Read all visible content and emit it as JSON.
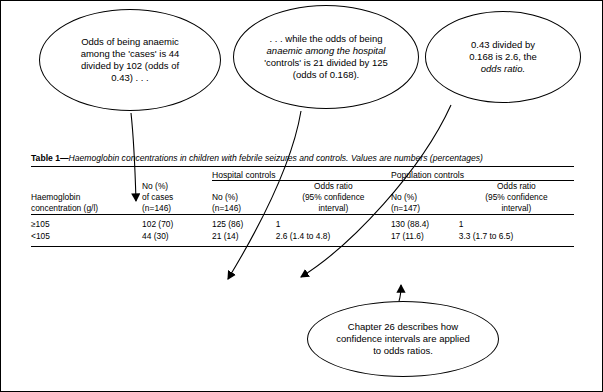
{
  "callouts": {
    "cases": {
      "line1": "Odds of being anaemic",
      "line2": "among the 'cases' is 44",
      "line3": "divided by 102 (odds of",
      "line4": "0.43) . . ."
    },
    "hospital": {
      "line1": ". . . while the odds of being",
      "line2": "anaemic among the hospital",
      "line3": "'controls' is 21 divided by 125",
      "line4": "(odds of 0.168)."
    },
    "ratio": {
      "line1": "0.43 divided by",
      "line2": "0.168 is 2.6, the",
      "line3": "odds ratio."
    },
    "chapter": {
      "line1": "Chapter 26 describes how",
      "line2": "confidence intervals are applied",
      "line3": "to odds ratios."
    }
  },
  "table": {
    "caption_label": "Table 1",
    "caption_dash": "—",
    "caption_text": "Haemoglobin concentrations in children with febrile seizures and controls. Values are numbers (percentages)",
    "group_headers": {
      "hospital": "Hospital controls",
      "population": "Population controls"
    },
    "column_headers": {
      "haemoglobin": [
        "Haemoglobin",
        "concentration (g/l)"
      ],
      "cases": [
        "No (%)",
        "of cases",
        "(n=146)"
      ],
      "hospital_no": [
        "No (%)",
        "(n=146)"
      ],
      "hospital_or": [
        "Odds ratio",
        "(95% confidence",
        "interval)"
      ],
      "population_no": [
        "No (%)",
        "(n=147)"
      ],
      "population_or": [
        "Odds ratio",
        "(95% confidence",
        "interval)"
      ]
    },
    "rows": [
      {
        "label": "≥105",
        "cases": "102 (70)",
        "hospital_no": "125 (86)",
        "hospital_or": "1",
        "population_no": "130 (88.4)",
        "population_or": "1"
      },
      {
        "label": "<105",
        "cases": "44 (30)",
        "hospital_no": "21 (14)",
        "hospital_or": "2.6 (1.4 to 4.8)",
        "population_no": "17 (11.6)",
        "population_or": "3.3 (1.7 to 6.5)"
      }
    ]
  }
}
